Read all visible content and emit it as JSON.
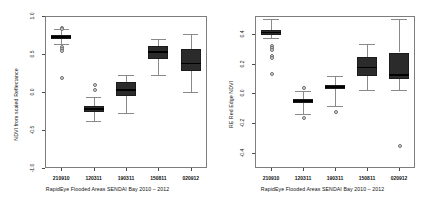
{
  "figure": {
    "caption": "RapidEye Flooded Areas SENDAI Bay 2010 – 2012",
    "box_fill_dark": "#2b2b2b",
    "box_fill_mid": "#3a3a3a",
    "axis_color": "#7d7d7d"
  },
  "panels": [
    {
      "id": "ndvi-scaled-reflectance",
      "ylabel": "NDVI from scaled Reflectance",
      "yticks": [
        "1.0",
        "0.5",
        "0.0",
        "-0.5",
        "-1.0"
      ],
      "xticks": [
        "210910",
        "120311",
        "190311",
        "150811",
        "020912"
      ],
      "caption": "RapidEye Flooded Areas SENDAI Bay 2010 – 2012"
    },
    {
      "id": "re-red-edge-ndvi",
      "ylabel": "RE Red Edge NDVI",
      "yticks": [
        "0.4",
        "0.2",
        "0.0",
        "-0.2",
        "-0.4"
      ],
      "xticks": [
        "210910",
        "120311",
        "190311",
        "150811",
        "020912"
      ],
      "caption": "RapidEye Flooded Areas SENDAI Bay 2010 – 2012"
    }
  ],
  "chart_data": [
    {
      "type": "box",
      "title": "",
      "xlabel": "RapidEye Flooded Areas SENDAI Bay 2010 – 2012",
      "ylabel": "NDVI from scaled Reflectance",
      "ylim": [
        -1.0,
        1.0
      ],
      "yticks": [
        1.0,
        0.5,
        0.0,
        -0.5,
        -1.0
      ],
      "grid": false,
      "legend": "none",
      "categories": [
        "210910",
        "120311",
        "190311",
        "150811",
        "020912"
      ],
      "boxes": [
        {
          "category": "210910",
          "whisker_low": 0.63,
          "q1": 0.7,
          "median": 0.725,
          "q3": 0.745,
          "whisker_high": 0.83,
          "outliers": [
            0.86,
            0.84,
            0.61,
            0.58,
            0.55,
            0.2
          ]
        },
        {
          "category": "120311",
          "whisker_low": -0.38,
          "q1": -0.265,
          "median": -0.225,
          "q3": -0.185,
          "whisker_high": -0.07,
          "outliers": [
            0.11,
            0.04
          ]
        },
        {
          "category": "190311",
          "whisker_low": -0.27,
          "q1": -0.055,
          "median": 0.03,
          "q3": 0.13,
          "whisker_high": 0.22,
          "outliers": []
        },
        {
          "category": "150811",
          "whisker_low": 0.23,
          "q1": 0.43,
          "median": 0.525,
          "q3": 0.6,
          "whisker_high": 0.7,
          "outliers": []
        },
        {
          "category": "020912",
          "whisker_low": 0.0,
          "q1": 0.28,
          "median": 0.375,
          "q3": 0.565,
          "whisker_high": 0.76,
          "outliers": []
        }
      ]
    },
    {
      "type": "box",
      "title": "",
      "xlabel": "RapidEye Flooded Areas SENDAI Bay 2010 – 2012",
      "ylabel": "RE Red Edge NDVI",
      "ylim": [
        -0.5,
        0.52
      ],
      "yticks": [
        0.4,
        0.2,
        0.0,
        -0.2,
        -0.4
      ],
      "grid": false,
      "legend": "none",
      "categories": [
        "210910",
        "120311",
        "190311",
        "150811",
        "020912"
      ],
      "boxes": [
        {
          "category": "210910",
          "whisker_low": 0.375,
          "q1": 0.395,
          "median": 0.41,
          "q3": 0.425,
          "whisker_high": 0.5,
          "outliers": [
            0.325,
            0.315,
            0.3,
            0.26,
            0.245,
            0.14
          ]
        },
        {
          "category": "120311",
          "whisker_low": -0.135,
          "q1": -0.065,
          "median": -0.05,
          "q3": -0.035,
          "whisker_high": 0.02,
          "outliers": [
            0.045,
            -0.155
          ]
        },
        {
          "category": "190311",
          "whisker_low": -0.085,
          "q1": 0.03,
          "median": 0.045,
          "q3": 0.06,
          "whisker_high": 0.115,
          "outliers": [
            -0.115
          ]
        },
        {
          "category": "150811",
          "whisker_low": 0.025,
          "q1": 0.115,
          "median": 0.175,
          "q3": 0.245,
          "whisker_high": 0.33,
          "outliers": []
        },
        {
          "category": "020912",
          "whisker_low": 0.025,
          "q1": 0.095,
          "median": 0.125,
          "q3": 0.275,
          "whisker_high": 0.5,
          "outliers": [
            -0.345
          ]
        }
      ]
    }
  ]
}
